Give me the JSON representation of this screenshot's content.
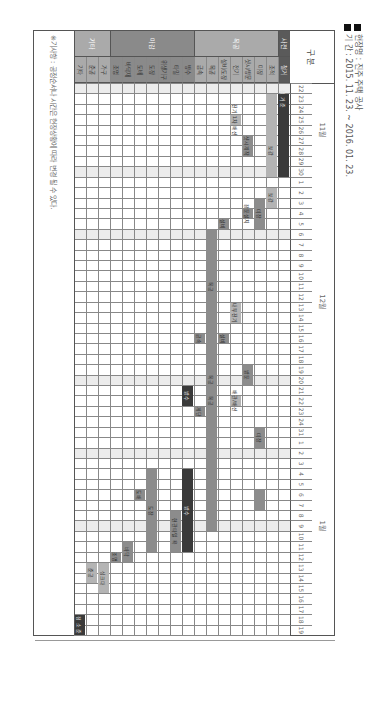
{
  "meta": {
    "site_label": "현장명 : 진주 주택 공사",
    "period_label": "기   간 : 2015. 11. 23. ~ 2016. 01. 23."
  },
  "header": {
    "group_label": "구    분"
  },
  "note": "※기사항 : 공정순서나 시간은 현장상황에 따라 변경 될 수 있다.",
  "colors": {
    "cat_dark": "#5a5a5a",
    "cat_mid": "#8a8a8a",
    "cat_light": "#aaaaaa",
    "bar_dark": "#3a3a3a",
    "bar_mid": "#8c8c8c",
    "bar_light": "#b4b4b4",
    "weekend_shade": "#ececec",
    "grid": "#888888"
  },
  "chart_data": {
    "type": "gantt",
    "period": "2015.11.23 ~ 2016.01.23",
    "months": [
      {
        "label": "11월",
        "start_col": 0,
        "span": 9
      },
      {
        "label": "12월",
        "start_col": 9,
        "span": 24
      },
      {
        "label": "1월",
        "start_col": 33,
        "span": 19
      }
    ],
    "days": [
      "22",
      "23",
      "24",
      "25",
      "26",
      "27",
      "28",
      "29",
      "30",
      "1",
      "2",
      "3",
      "4",
      "5",
      "6",
      "7",
      "8",
      "9",
      "10",
      "11",
      "12",
      "13",
      "14",
      "15",
      "16",
      "17",
      "18",
      "19",
      "20",
      "21",
      "22",
      "23",
      "24",
      "31",
      "1",
      "2",
      "3",
      "4",
      "5",
      "6",
      "7",
      "8",
      "9",
      "10",
      "11",
      "12",
      "13",
      "14",
      "15",
      "16",
      "17",
      "18",
      "19"
    ],
    "shaded_cols": [
      0,
      8,
      14,
      28,
      35,
      42
    ],
    "categories": [
      {
        "label": "사전",
        "row_start": 0,
        "row_span": 1,
        "color": "cat_dark"
      },
      {
        "label": "목공",
        "row_start": 1,
        "row_span": 7,
        "color": "cat_light"
      },
      {
        "label": "마감",
        "row_start": 8,
        "row_span": 7,
        "color": "cat_mid"
      },
      {
        "label": "기타",
        "row_start": 15,
        "row_span": 3,
        "color": "cat_light"
      }
    ],
    "tasks": [
      "철거",
      "조적",
      "미장",
      "샷시/방문",
      "전기",
      "설비/도장",
      "목공",
      "금속",
      "방수",
      "타일",
      "위생기구",
      "도장",
      "도배",
      "바닥재",
      "조명",
      "가구",
      "준공",
      "기타"
    ],
    "bars": [
      {
        "row": 0,
        "start": 1,
        "end": 8,
        "label": "",
        "color": "bar_dark"
      },
      {
        "row": 0,
        "start": 1,
        "end": 1,
        "label": "철 거 준",
        "color": "bar_dark"
      },
      {
        "row": 1,
        "start": 1,
        "end": 8,
        "label": "",
        "color": "bar_light"
      },
      {
        "row": 1,
        "start": 6,
        "end": 6,
        "label": "보강",
        "color": "bar_light"
      },
      {
        "row": 1,
        "start": 10,
        "end": 11,
        "label": "보강",
        "color": "bar_light"
      },
      {
        "row": 2,
        "start": 11,
        "end": 13,
        "label": "미장",
        "color": "bar_mid"
      },
      {
        "row": 2,
        "start": 33,
        "end": 34,
        "label": "미장",
        "color": "bar_mid"
      },
      {
        "row": 2,
        "start": 39,
        "end": 40,
        "label": "",
        "color": "bar_mid"
      },
      {
        "row": 3,
        "start": 5,
        "end": 6,
        "label": "샷시제작",
        "color": "bar_mid"
      },
      {
        "row": 3,
        "start": 12,
        "end": 12,
        "label": "창문설치",
        "color": "bar_mid"
      },
      {
        "row": 3,
        "start": 27,
        "end": 28,
        "label": "방문",
        "color": "bar_mid"
      },
      {
        "row": 4,
        "start": 3,
        "end": 3,
        "label": "전기 1차 배선",
        "color": "bar_light"
      },
      {
        "row": 4,
        "start": 21,
        "end": 22,
        "label": "내부전기",
        "color": "bar_light"
      },
      {
        "row": 4,
        "start": 30,
        "end": 30,
        "label": "배관/배선",
        "color": "bar_light"
      },
      {
        "row": 5,
        "start": 13,
        "end": 13,
        "label": "설비",
        "color": "bar_mid"
      },
      {
        "row": 5,
        "start": 24,
        "end": 24,
        "label": "설비",
        "color": "bar_mid"
      },
      {
        "row": 6,
        "start": 14,
        "end": 42,
        "label": "목공",
        "color": "bar_mid"
      },
      {
        "row": 6,
        "start": 19,
        "end": 19,
        "label": "목공",
        "color": "bar_mid"
      },
      {
        "row": 6,
        "start": 30,
        "end": 30,
        "label": "목공",
        "color": "bar_mid"
      },
      {
        "row": 7,
        "start": 24,
        "end": 24,
        "label": "금속",
        "color": "bar_mid"
      },
      {
        "row": 7,
        "start": 31,
        "end": 31,
        "label": "계단",
        "color": "bar_mid"
      },
      {
        "row": 8,
        "start": 29,
        "end": 30,
        "label": "방수",
        "color": "bar_dark"
      },
      {
        "row": 8,
        "start": 37,
        "end": 44,
        "label": "방수",
        "color": "bar_dark"
      },
      {
        "row": 9,
        "start": 41,
        "end": 44,
        "label": "현관타일 욕",
        "color": "bar_mid"
      },
      {
        "row": 11,
        "start": 37,
        "end": 44,
        "label": "도장",
        "color": "bar_mid"
      },
      {
        "row": 12,
        "start": 39,
        "end": 39,
        "label": "도배",
        "color": "bar_mid"
      },
      {
        "row": 13,
        "start": 44,
        "end": 45,
        "label": "바닥",
        "color": "bar_mid"
      },
      {
        "row": 14,
        "start": 45,
        "end": 45,
        "label": "조명",
        "color": "bar_mid"
      },
      {
        "row": 15,
        "start": 46,
        "end": 48,
        "label": "싱크대",
        "color": "bar_light"
      },
      {
        "row": 16,
        "start": 46,
        "end": 47,
        "label": "준공",
        "color": "bar_light"
      },
      {
        "row": 17,
        "start": 52,
        "end": 52,
        "label": "",
        "color": "bar_light"
      },
      {
        "row": 17,
        "start": 51,
        "end": 52,
        "label": "청 소 준",
        "color": "bar_dark"
      }
    ]
  }
}
